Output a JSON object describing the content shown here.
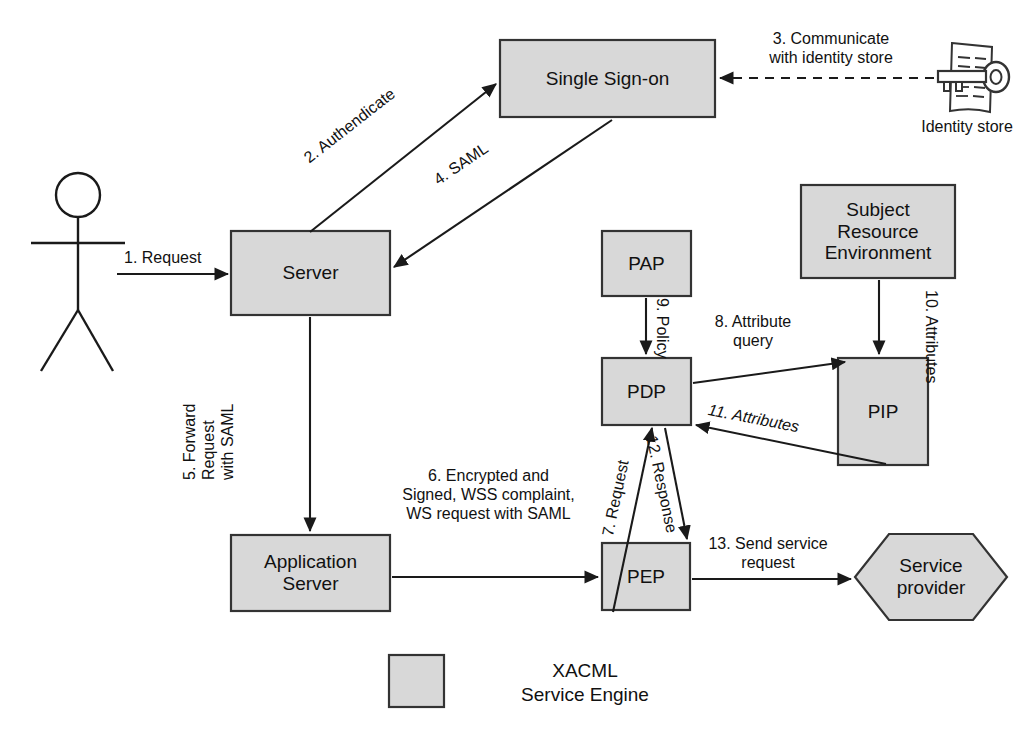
{
  "diagram": {
    "colors": {
      "node_fill": "#d8d8d8",
      "node_stroke": "#333333",
      "line": "#1a1a1a",
      "text": "#111111",
      "background": "#ffffff"
    }
  },
  "nodes": {
    "actor": {
      "name": "user-actor",
      "label": ""
    },
    "single_sign_on": {
      "label": "Single Sign-on"
    },
    "identity_store": {
      "label": "Identity store"
    },
    "server": {
      "label": "Server"
    },
    "application_server": {
      "label": "Application\nServer"
    },
    "pap": {
      "label": "PAP"
    },
    "pdp": {
      "label": "PDP"
    },
    "pip": {
      "label": "PIP"
    },
    "pep": {
      "label": "PEP"
    },
    "subject_resource_environment": {
      "label": "Subject\nResource\nEnvironment"
    },
    "service_provider": {
      "label": "Service\nprovider"
    }
  },
  "edges": {
    "e1": {
      "label": "1. Request",
      "from": "actor",
      "to": "server"
    },
    "e2": {
      "label": "2. Authendicate",
      "from": "server",
      "to": "single_sign_on"
    },
    "e3": {
      "label": "3. Communicate\nwith identity store",
      "from": "identity_store",
      "to": "single_sign_on",
      "style": "dashed"
    },
    "e4": {
      "label": "4. SAML",
      "from": "single_sign_on",
      "to": "server"
    },
    "e5": {
      "label": "5. Forward\nRequest\nwith SAML",
      "from": "server",
      "to": "application_server"
    },
    "e6": {
      "label": "6. Encrypted and\nSigned, WSS complaint,\nWS request with SAML",
      "from": "application_server",
      "to": "pep"
    },
    "e7": {
      "label": "7. Request",
      "from": "pep",
      "to": "pdp"
    },
    "e8": {
      "label": "8. Attribute\nquery",
      "from": "pdp",
      "to": "pip"
    },
    "e9": {
      "label": "9. Policy",
      "from": "pap",
      "to": "pdp"
    },
    "e10": {
      "label": "10. Attributes",
      "from": "subject_resource_environment",
      "to": "pip"
    },
    "e11": {
      "label": "11. Attributes",
      "from": "pip",
      "to": "pdp"
    },
    "e12": {
      "label": "12. Response",
      "from": "pdp",
      "to": "pep"
    },
    "e13": {
      "label": "13. Send service\nrequest",
      "from": "pep",
      "to": "service_provider"
    }
  },
  "legend": {
    "swatch_name": "xacml-service-engine-swatch",
    "label": "XACML\nService Engine"
  }
}
